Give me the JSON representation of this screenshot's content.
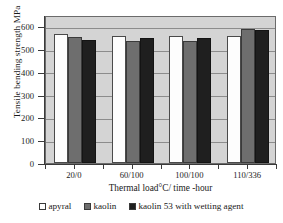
{
  "chart_data": {
    "type": "bar",
    "title": "",
    "xlabel": "Thermal load°C/ time -hour",
    "ylabel": "Tensile bending strength MPa",
    "categories": [
      "20/0",
      "60/100",
      "100/100",
      "110/336"
    ],
    "yticks": [
      0,
      100,
      200,
      300,
      400,
      500,
      600
    ],
    "ylim": [
      0,
      650
    ],
    "grid": true,
    "legend_position": "bottom",
    "series": [
      {
        "name": "apyral",
        "color": "#ffffff",
        "values": [
          565,
          558,
          558,
          558
        ]
      },
      {
        "name": "kaolin",
        "color": "#6e6e6e",
        "values": [
          552,
          537,
          538,
          590
        ]
      },
      {
        "name": "kaolin 53 with wetting agent",
        "color": "#1f1f1f",
        "values": [
          541,
          551,
          551,
          582
        ]
      }
    ]
  },
  "legend": {
    "items": [
      {
        "label": "apyral"
      },
      {
        "label": "kaolin"
      },
      {
        "label": "kaolin 53 with wetting agent"
      }
    ]
  }
}
